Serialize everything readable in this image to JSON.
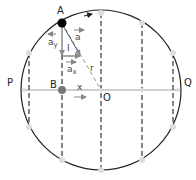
{
  "diagram": {
    "center": {
      "x": 101,
      "y": 90
    },
    "radius": 80,
    "colors": {
      "circle": "#222222",
      "dashed": "#333333",
      "axis": "#888888",
      "point_A": "#000000",
      "point_B": "#777777",
      "marker": "#dddddd",
      "arrow": "#888888"
    },
    "labels": {
      "A": "A",
      "B": "B",
      "O": "O",
      "P": "P",
      "Q": "Q",
      "r": "r",
      "x": "x",
      "a": "a",
      "ay": "a",
      "ay_sub": "y",
      "ax": "a",
      "ax_sub": "x",
      "theta": "I"
    },
    "markers": [
      {
        "x": 101,
        "y": 13
      },
      {
        "x": 142,
        "y": 23
      },
      {
        "x": 29,
        "y": 53
      },
      {
        "x": 173,
        "y": 53
      },
      {
        "x": 29,
        "y": 127
      },
      {
        "x": 173,
        "y": 127
      },
      {
        "x": 62,
        "y": 160
      },
      {
        "x": 101,
        "y": 170
      },
      {
        "x": 142,
        "y": 160
      },
      {
        "x": 24,
        "y": 90
      },
      {
        "x": 142,
        "y": 90
      },
      {
        "x": 178,
        "y": 90
      }
    ],
    "dashed_chords_x": [
      29,
      62,
      101,
      142,
      173
    ]
  }
}
